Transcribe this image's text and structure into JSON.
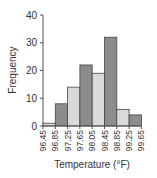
{
  "chart_data": {
    "type": "bar",
    "title": "",
    "xlabel": "Temperature (°F)",
    "ylabel": "Frequency",
    "ylim": [
      0,
      40
    ],
    "yticks": [
      0,
      10,
      20,
      30,
      40
    ],
    "bin_edges": [
      "96.45",
      "96.85",
      "97.25",
      "97.65",
      "98.05",
      "98.45",
      "98.85",
      "99.25",
      "99.65"
    ],
    "categories": [
      "96.45–96.85",
      "96.85–97.25",
      "97.25–97.65",
      "97.65–98.05",
      "98.05–98.45",
      "98.45–98.85",
      "98.85–99.25",
      "99.25–99.65"
    ],
    "values": [
      1,
      8,
      14,
      22,
      19,
      32,
      6,
      4
    ],
    "bar_colors": [
      "#d9d9d9",
      "#8c8c8c",
      "#d9d9d9",
      "#8c8c8c",
      "#d9d9d9",
      "#8c8c8c",
      "#d9d9d9",
      "#8c8c8c"
    ],
    "grid": false,
    "legend": null
  }
}
